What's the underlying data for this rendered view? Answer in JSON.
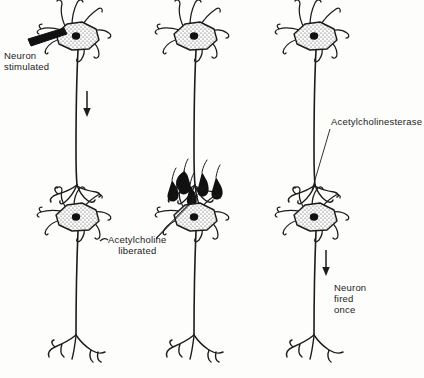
{
  "figure": {
    "background_color": "#fdfdfc",
    "ink_color": "#1b1b1b",
    "width": 424,
    "height": 378
  },
  "labels": {
    "neuron_stimulated": "Neuron\nstimulated",
    "acetylcholine_liberated": "Acetylcholine\nliberated",
    "acetylcholinesterase": "Acetylcholinesterase",
    "neuron_fired_once": "Neuron\nfired\nonce"
  },
  "columns": [
    {
      "index": 1,
      "stage": "stimulation",
      "caption": "Neuron\nstimulated",
      "has_electrode": true,
      "has_impulse_arrow": true,
      "has_vesicles": false,
      "neurons": 2
    },
    {
      "index": 2,
      "stage": "transmitter-release",
      "caption": "Acetylcholine\nliberated",
      "has_electrode": false,
      "has_impulse_arrow": false,
      "has_vesicles": true,
      "vesicle_count": 5,
      "neurons": 2
    },
    {
      "index": 3,
      "stage": "enzyme-breakdown-and-firing",
      "caption": "Acetylcholinesterase",
      "caption_secondary": "Neuron\nfired\nonce",
      "has_electrode": false,
      "has_impulse_arrow": true,
      "has_vesicles": false,
      "neurons": 2
    }
  ],
  "icons": {
    "electrode": "electrode-icon",
    "arrow_down": "arrow-down-icon",
    "leader_line": "leader-line-icon",
    "vesicle": "vesicle-icon",
    "soma": "soma-icon",
    "nucleus": "nucleus-icon"
  }
}
